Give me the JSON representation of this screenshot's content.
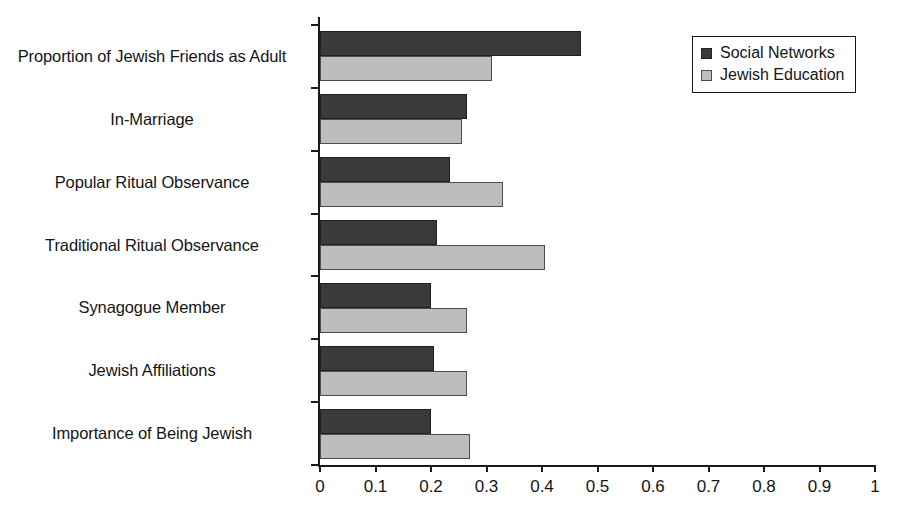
{
  "chart_data": {
    "type": "bar",
    "orientation": "horizontal",
    "title": "",
    "xlabel": "",
    "ylabel": "",
    "xlim": [
      0,
      1
    ],
    "grid": false,
    "legend_position": "top-right",
    "categories": [
      "Proportion of Jewish Friends as Adult",
      "In-Marriage",
      "Popular Ritual Observance",
      "Traditional Ritual Observance",
      "Synagogue Member",
      "Jewish Affiliations",
      "Importance of Being Jewish"
    ],
    "series": [
      {
        "name": "Social Networks",
        "color": "#3a3a3a",
        "values": [
          0.47,
          0.265,
          0.235,
          0.21,
          0.2,
          0.205,
          0.2
        ]
      },
      {
        "name": "Jewish Education",
        "color": "#bdbdbd",
        "values": [
          0.31,
          0.255,
          0.33,
          0.405,
          0.265,
          0.265,
          0.27
        ]
      }
    ],
    "xticks": [
      0,
      0.1,
      0.2,
      0.3,
      0.4,
      0.5,
      0.6,
      0.7,
      0.8,
      0.9,
      1
    ],
    "xticklabels": [
      "0",
      "0.1",
      "0.2",
      "0.3",
      "0.4",
      "0.5",
      "0.6",
      "0.7",
      "0.8",
      "0.9",
      "1"
    ]
  },
  "legend": {
    "entries": [
      {
        "label": "Social Networks"
      },
      {
        "label": "Jewish Education"
      }
    ]
  }
}
